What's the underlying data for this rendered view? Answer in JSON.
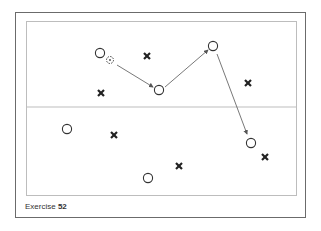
{
  "caption": {
    "prefix": "Exercise",
    "number": "52"
  },
  "colors": {
    "frame": "#6b6b6b",
    "field_line": "#bdbdbd",
    "player_stroke": "#333333",
    "opponent": "#222222",
    "arrow": "#555555"
  },
  "field": {
    "halfway_line_y": 107
  },
  "players": [
    {
      "id": "p1",
      "x": 100,
      "y": 53
    },
    {
      "id": "p2",
      "x": 159,
      "y": 90
    },
    {
      "id": "p3",
      "x": 213,
      "y": 46
    },
    {
      "id": "p4",
      "x": 67,
      "y": 129
    },
    {
      "id": "p5",
      "x": 148,
      "y": 178
    },
    {
      "id": "p6",
      "x": 251,
      "y": 143
    }
  ],
  "ball": {
    "x": 110,
    "y": 60
  },
  "opponents": [
    {
      "id": "o1",
      "x": 147,
      "y": 56
    },
    {
      "id": "o2",
      "x": 101,
      "y": 93
    },
    {
      "id": "o3",
      "x": 248,
      "y": 83
    },
    {
      "id": "o4",
      "x": 114,
      "y": 135
    },
    {
      "id": "o5",
      "x": 179,
      "y": 166
    },
    {
      "id": "o6",
      "x": 265,
      "y": 157
    }
  ],
  "passes": [
    {
      "from": [
        117,
        65
      ],
      "to": [
        153,
        87
      ]
    },
    {
      "from": [
        165,
        87
      ],
      "to": [
        208,
        50
      ]
    },
    {
      "from": [
        217,
        54
      ],
      "to": [
        247,
        134
      ]
    }
  ]
}
